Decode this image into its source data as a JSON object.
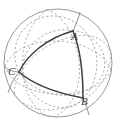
{
  "figure": {
    "name": "spherical-triangle-diagram",
    "width": 122,
    "height": 127,
    "background_color": "#ffffff"
  },
  "colors": {
    "sphere_outline": "#8c8c8c",
    "hidden_arc": "#9a9a9a",
    "visible_arc": "#3d3d3d",
    "label": "#3b3b3b"
  },
  "sphere": {
    "name": "sphere-outline",
    "center_x": 58,
    "center_y": 63,
    "radius": 54,
    "stroke_width": 0.9
  },
  "vertices": [
    {
      "id": "A",
      "label": "A",
      "x": 73,
      "y": 31,
      "label_x": 71,
      "label_y": 31
    },
    {
      "id": "B",
      "label": "B",
      "x": 83,
      "y": 98,
      "label_x": 81,
      "label_y": 96
    },
    {
      "id": "C",
      "label": "C",
      "x": 19,
      "y": 72,
      "label_x": 8,
      "label_y": 66
    }
  ],
  "arcs": {
    "visible": [
      {
        "name": "arc-CA",
        "from": "C",
        "to": "A",
        "style": "solid"
      },
      {
        "name": "arc-AB",
        "from": "A",
        "to": "B",
        "style": "solid"
      },
      {
        "name": "arc-BC",
        "from": "B",
        "to": "C",
        "style": "solid"
      }
    ],
    "hidden": [
      {
        "name": "great-circle-1-hidden",
        "style": "dashed"
      },
      {
        "name": "great-circle-2-hidden",
        "style": "dashed"
      },
      {
        "name": "great-circle-3-hidden",
        "style": "dashed"
      }
    ],
    "dash_pattern": "2.2 2.2"
  }
}
